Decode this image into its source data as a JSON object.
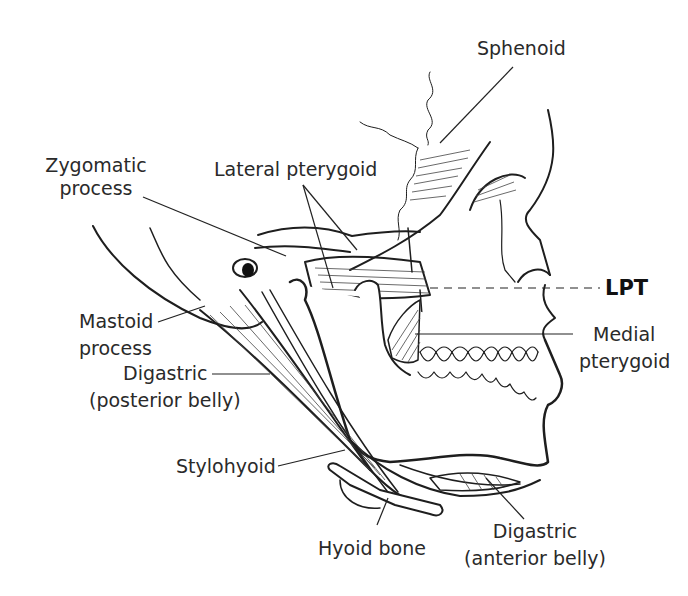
{
  "figure": {
    "labels": {
      "sphenoid": "Sphenoid",
      "zygomatic_process_line1": "Zygomatic",
      "zygomatic_process_line2": "process",
      "lateral_pterygoid": "Lateral pterygoid",
      "lpt": "LPT",
      "mastoid_process_line1": "Mastoid",
      "mastoid_process_line2": "process",
      "medial_pterygoid_line1": "Medial",
      "medial_pterygoid_line2": "pterygoid",
      "digastric_posterior_line1": "Digastric",
      "digastric_posterior_line2": "(posterior belly)",
      "stylohyoid": "Stylohyoid",
      "hyoid_bone": "Hyoid bone",
      "digastric_anterior_line1": "Digastric",
      "digastric_anterior_line2": "(anterior belly)"
    },
    "colors": {
      "ink": "#1e1e1e",
      "background": "#ffffff"
    }
  }
}
